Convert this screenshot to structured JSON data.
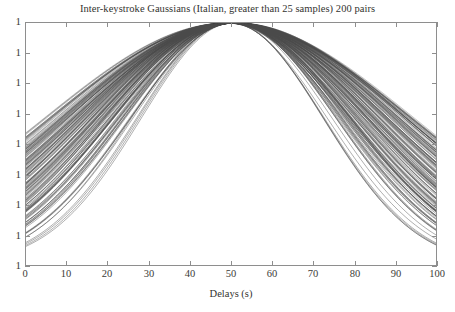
{
  "figure": {
    "title": "Inter-keystroke Gaussians (Italian, greater than 25 samples) 200 pairs",
    "background_color": "#ffffff",
    "frame_color": "#8e8e8e",
    "curve_color": "#4a4a4a"
  },
  "axes": {
    "x_title": "Delays (s)",
    "y_title": "",
    "x_ticks": [
      "0",
      "10",
      "20",
      "30",
      "40",
      "50",
      "60",
      "70",
      "80",
      "90",
      "100"
    ],
    "y_ticks": [
      "1",
      "1",
      "1",
      "1",
      "1",
      "1",
      "1",
      "1",
      "1"
    ]
  },
  "chart_data": {
    "type": "line",
    "title": "Inter-keystroke Gaussians (Italian, greater than 25 samples) 200 pairs",
    "xlabel": "Delays (s)",
    "ylabel": "",
    "xlim": [
      0,
      100
    ],
    "ylim": [
      0,
      1
    ],
    "xticks": [
      0,
      10,
      20,
      30,
      40,
      50,
      60,
      70,
      80,
      90,
      100
    ],
    "xticklabels": [
      "0",
      "10",
      "20",
      "30",
      "40",
      "50",
      "60",
      "70",
      "80",
      "90",
      "100"
    ],
    "yticklabels": [
      "1",
      "1",
      "1",
      "1",
      "1",
      "1",
      "1",
      "1",
      "1"
    ],
    "grid": false,
    "legend": false,
    "n_series": 200,
    "series_description": "200 overlaid normalized Gaussian probability density curves of inter-keystroke delay distributions, all peaking near x=50 s at normalized amplitude 1, with standard deviations ranging from about 22 s to 46 s",
    "series_model": "y = exp(-((x - mu)^2) / (2 * sigma^2))",
    "series_params": [
      {
        "mu": 50.0,
        "sigma": 44.0
      },
      {
        "mu": 49.6,
        "sigma": 43.5
      },
      {
        "mu": 50.4,
        "sigma": 43.2
      },
      {
        "mu": 50.1,
        "sigma": 42.8
      },
      {
        "mu": 49.3,
        "sigma": 42.5
      },
      {
        "mu": 50.7,
        "sigma": 42.1
      },
      {
        "mu": 49.9,
        "sigma": 41.8
      },
      {
        "mu": 50.2,
        "sigma": 41.4
      },
      {
        "mu": 49.5,
        "sigma": 41.0
      },
      {
        "mu": 50.6,
        "sigma": 40.7
      },
      {
        "mu": 50.0,
        "sigma": 40.3
      },
      {
        "mu": 49.7,
        "sigma": 40.0
      },
      {
        "mu": 50.3,
        "sigma": 39.6
      },
      {
        "mu": 49.2,
        "sigma": 39.3
      },
      {
        "mu": 50.8,
        "sigma": 38.9
      },
      {
        "mu": 50.1,
        "sigma": 38.6
      },
      {
        "mu": 49.8,
        "sigma": 38.2
      },
      {
        "mu": 50.5,
        "sigma": 37.9
      },
      {
        "mu": 49.4,
        "sigma": 37.5
      },
      {
        "mu": 50.2,
        "sigma": 37.2
      },
      {
        "mu": 50.0,
        "sigma": 36.8
      },
      {
        "mu": 49.6,
        "sigma": 36.5
      },
      {
        "mu": 50.4,
        "sigma": 36.1
      },
      {
        "mu": 49.9,
        "sigma": 35.8
      },
      {
        "mu": 50.3,
        "sigma": 35.4
      },
      {
        "mu": 49.5,
        "sigma": 35.1
      },
      {
        "mu": 50.7,
        "sigma": 34.7
      },
      {
        "mu": 50.1,
        "sigma": 34.4
      },
      {
        "mu": 49.7,
        "sigma": 34.0
      },
      {
        "mu": 50.2,
        "sigma": 33.7
      },
      {
        "mu": 49.3,
        "sigma": 33.3
      },
      {
        "mu": 50.6,
        "sigma": 33.0
      },
      {
        "mu": 50.0,
        "sigma": 32.6
      },
      {
        "mu": 49.8,
        "sigma": 32.3
      },
      {
        "mu": 50.4,
        "sigma": 31.9
      },
      {
        "mu": 49.4,
        "sigma": 31.6
      },
      {
        "mu": 50.2,
        "sigma": 31.2
      },
      {
        "mu": 50.0,
        "sigma": 30.9
      },
      {
        "mu": 49.6,
        "sigma": 30.5
      },
      {
        "mu": 50.5,
        "sigma": 30.2
      },
      {
        "mu": 49.9,
        "sigma": 29.8
      },
      {
        "mu": 50.3,
        "sigma": 29.4
      },
      {
        "mu": 49.5,
        "sigma": 29.0
      },
      {
        "mu": 50.7,
        "sigma": 28.5
      },
      {
        "mu": 50.1,
        "sigma": 28.0
      },
      {
        "mu": 49.7,
        "sigma": 27.4
      },
      {
        "mu": 50.2,
        "sigma": 26.7
      },
      {
        "mu": 50.0,
        "sigma": 25.8
      },
      {
        "mu": 49.8,
        "sigma": 24.6
      },
      {
        "mu": 50.4,
        "sigma": 22.8
      }
    ]
  }
}
